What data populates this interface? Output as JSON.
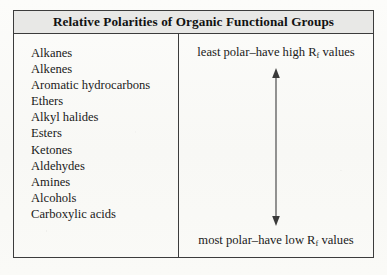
{
  "table": {
    "title": "Relative Polarities of Organic Functional Groups",
    "left_column": {
      "items": [
        "Alkanes",
        "Alkenes",
        "Aromatic hydrocarbons",
        "Ethers",
        "Alkyl halides",
        "Esters",
        "Ketones",
        "Aldehydes",
        "Amines",
        "Alcohols",
        "Carboxylic acids"
      ]
    },
    "right_column": {
      "top_label_prefix": "least polar–have high R",
      "top_label_subscript": "f",
      "top_label_suffix": " values",
      "bottom_label_prefix": "most polar–have low R",
      "bottom_label_subscript": "f",
      "bottom_label_suffix": " values",
      "arrow": "double-headed-vertical-arrow"
    }
  },
  "colors": {
    "page_background": "#fbfbf9",
    "border": "#3c3c3c",
    "header_fill": "#e8e8e6",
    "text": "#1a1a1a",
    "arrow": "#5a5a5a"
  }
}
